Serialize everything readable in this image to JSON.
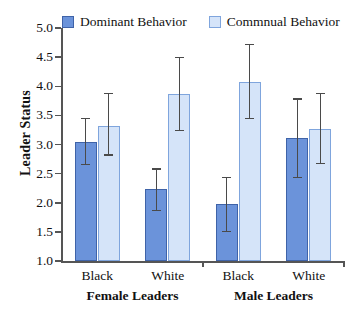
{
  "chart_data": {
    "type": "bar",
    "title": "",
    "xlabel": "",
    "ylabel": "Leader Status",
    "ylim": [
      1.0,
      5.0
    ],
    "ytick_labels": [
      "1.0",
      "1.5",
      "2.0",
      "2.5",
      "3.0",
      "3.5",
      "4.0",
      "4.5",
      "5.0"
    ],
    "ytick_values": [
      1.0,
      1.5,
      2.0,
      2.5,
      3.0,
      3.5,
      4.0,
      4.5,
      5.0
    ],
    "grid": false,
    "legend_position": "top",
    "categories": [
      "Black",
      "White",
      "Black",
      "White"
    ],
    "group_labels": [
      "Female Leaders",
      "Male Leaders"
    ],
    "series": [
      {
        "name": "Dominant Behavior",
        "color": "#6b93da",
        "border": "#3f63a8",
        "values": [
          3.05,
          2.23,
          1.97,
          3.11
        ],
        "err_low": [
          2.65,
          1.87,
          1.5,
          2.44
        ],
        "err_high": [
          3.45,
          2.58,
          2.43,
          3.78
        ]
      },
      {
        "name": "Commnual Behavior",
        "color": "#d5e4f9",
        "border": "#7fa5dd",
        "values": [
          3.32,
          3.86,
          4.07,
          3.27
        ],
        "err_low": [
          2.82,
          3.24,
          3.45,
          2.67
        ],
        "err_high": [
          3.88,
          4.5,
          4.72,
          3.88
        ]
      }
    ]
  },
  "legend": {
    "items": [
      {
        "label": "Dominant Behavior",
        "swatch": "legend-swatch-dominant"
      },
      {
        "label": "Commnual Behavior",
        "swatch": "legend-swatch-communal"
      }
    ]
  },
  "axes": {
    "y_title": "Leader Status"
  }
}
